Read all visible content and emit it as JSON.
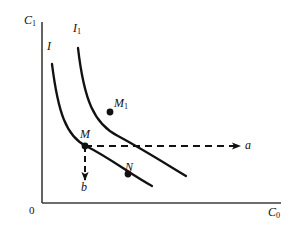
{
  "figure": {
    "background_color": "#ffffff",
    "stroke_color": "#111111"
  },
  "axes": {
    "y_label": "C",
    "y_label_sub": "1",
    "x_label": "C",
    "x_label_sub": "0",
    "origin_label": "0"
  },
  "curves": [
    {
      "name": "indifference-curve-i",
      "label": "I",
      "label_sub": "",
      "path": "M 52,64 C 58,112 66,136 86,146 C 110,158 130,174 152,186"
    },
    {
      "name": "indifference-curve-i1",
      "label": "I",
      "label_sub": "1",
      "path": "M 78,48 C 84,100 94,124 118,136 C 144,150 166,164 186,176"
    }
  ],
  "points": [
    {
      "name": "point-m1",
      "label": "M",
      "label_sub": "1",
      "x": 110,
      "y": 112
    },
    {
      "name": "point-m",
      "label": "M",
      "label_sub": "",
      "x": 85,
      "y": 146
    },
    {
      "name": "point-n",
      "label": "N",
      "label_sub": "",
      "x": 128,
      "y": 174
    }
  ],
  "arrows": [
    {
      "name": "arrow-a",
      "label": "a",
      "direction": "right",
      "from_x": 85,
      "from_y": 146,
      "to_x": 240,
      "to_y": 146,
      "style": "dashed"
    },
    {
      "name": "arrow-b",
      "label": "b",
      "direction": "down",
      "from_x": 85,
      "from_y": 146,
      "to_x": 85,
      "to_y": 180,
      "style": "dashed"
    }
  ]
}
